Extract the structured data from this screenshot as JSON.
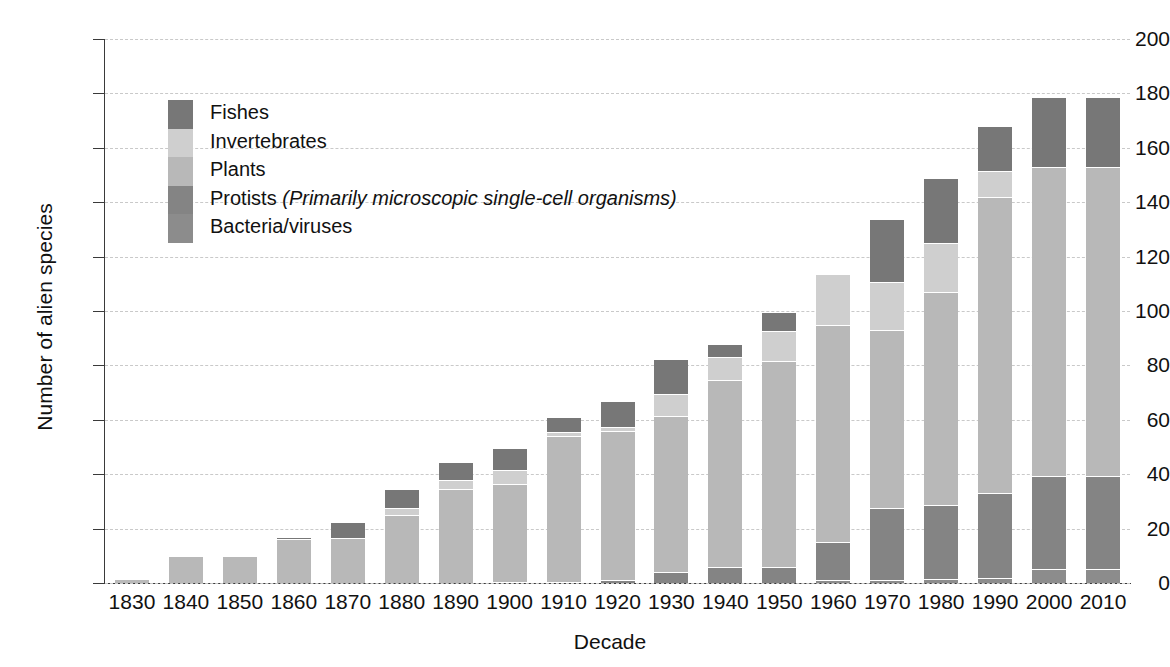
{
  "chart_data": {
    "type": "bar",
    "subtype": "stacked-bar",
    "title": "",
    "xlabel": "Decade",
    "ylabel": "Number of alien species",
    "ylim": [
      0,
      200
    ],
    "yticks": [
      0,
      20,
      40,
      60,
      80,
      100,
      120,
      140,
      160,
      180,
      200
    ],
    "grid": true,
    "legend_position": "inside-top-left",
    "categories": [
      "1830",
      "1840",
      "1850",
      "1860",
      "1870",
      "1880",
      "1890",
      "1900",
      "1910",
      "1920",
      "1930",
      "1940",
      "1950",
      "1960",
      "1970",
      "1980",
      "1990",
      "2000",
      "2010"
    ],
    "series": [
      {
        "name": "Bacteria/viruses",
        "color": "#8c8c8c",
        "values": [
          0,
          0,
          0,
          0,
          0,
          0,
          0,
          0,
          0,
          0,
          0,
          0,
          0,
          1,
          1,
          1.5,
          2,
          5,
          5
        ]
      },
      {
        "name": "Protists",
        "color": "#848484",
        "values": [
          0,
          0,
          0,
          0,
          0,
          0,
          0,
          0.5,
          0.5,
          1,
          4,
          6,
          6,
          14,
          26.5,
          27,
          31,
          34.5,
          34.5
        ]
      },
      {
        "name": "Plants",
        "color": "#b8b8b8",
        "values": [
          1.5,
          10,
          10,
          16,
          16.5,
          25,
          34.5,
          36,
          53.5,
          55,
          57.5,
          68.5,
          75.5,
          80,
          65.5,
          78.5,
          109,
          113.5,
          113.5
        ]
      },
      {
        "name": "Invertebrates",
        "color": "#cfcfcf",
        "values": [
          0,
          0,
          0,
          0,
          0,
          2.5,
          3.5,
          5,
          1.5,
          1.5,
          8,
          8.5,
          11,
          18.5,
          17.5,
          18,
          9.5,
          0,
          0
        ]
      },
      {
        "name": "Fishes",
        "color": "#777777",
        "values": [
          0,
          0,
          0,
          1,
          6,
          7,
          6.5,
          8,
          5.5,
          9.5,
          13,
          5,
          7,
          0.5,
          23.5,
          24,
          16.5,
          25.5,
          25.5
        ]
      }
    ],
    "totals": [
      1.5,
      10,
      10,
      17,
      22.5,
      34.5,
      44.5,
      49.5,
      61,
      67,
      82.5,
      88,
      99.5,
      114,
      134,
      149,
      168,
      178.5,
      178.5
    ],
    "legend_entries": [
      {
        "label": "Fishes",
        "note": "",
        "color": "#777777"
      },
      {
        "label": "Invertebrates",
        "note": "",
        "color": "#cfcfcf"
      },
      {
        "label": "Plants",
        "note": "",
        "color": "#b8b8b8"
      },
      {
        "label": "Protists ",
        "note": "(Primarily microscopic single-cell organisms)",
        "color": "#848484"
      },
      {
        "label": "Bacteria/viruses",
        "note": "",
        "color": "#8c8c8c"
      }
    ]
  },
  "axes": {
    "y_title": "Number of alien species",
    "x_title": "Decade",
    "y_tick_labels": [
      "200",
      "180",
      "160",
      "140",
      "120",
      "100",
      "80",
      "60",
      "40",
      "20",
      "0"
    ],
    "x_tick_labels": [
      "1830",
      "1840",
      "1850",
      "1860",
      "1870",
      "1880",
      "1890",
      "1900",
      "1910",
      "1920",
      "1930",
      "1940",
      "1950",
      "1960",
      "1970",
      "1980",
      "1990",
      "2000",
      "2010"
    ]
  },
  "style": {
    "background": "#ffffff",
    "axis_color": "#3a3a3a",
    "grid_color": "#c9c9c9",
    "text_color": "#111111"
  }
}
